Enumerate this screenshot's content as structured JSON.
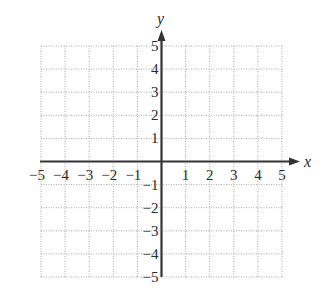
{
  "chart_data": {
    "type": "scatter",
    "title": "",
    "xlabel": "x",
    "ylabel": "y",
    "xlim": [
      -5,
      5
    ],
    "ylim": [
      -5,
      5
    ],
    "grid": true,
    "grid_style": "dotted",
    "x_ticks": [
      -5,
      -4,
      -3,
      -2,
      -1,
      1,
      2,
      3,
      4,
      5
    ],
    "y_ticks": [
      -5,
      -4,
      -3,
      -2,
      -1,
      1,
      2,
      3,
      4,
      5
    ],
    "x_tick_labels": [
      "−5",
      "−4",
      "−3",
      "−2",
      "−1",
      "1",
      "2",
      "3",
      "4",
      "5"
    ],
    "y_tick_labels": [
      "−5",
      "−4",
      "−3",
      "−2",
      "−1",
      "1",
      "2",
      "3",
      "4",
      "5"
    ],
    "series": [],
    "legend": null
  },
  "axes": {
    "x_label": "x",
    "y_label": "y"
  },
  "colors": {
    "axis": "#333333",
    "grid": "#aaaaaa",
    "text": "#2a2a2a"
  }
}
